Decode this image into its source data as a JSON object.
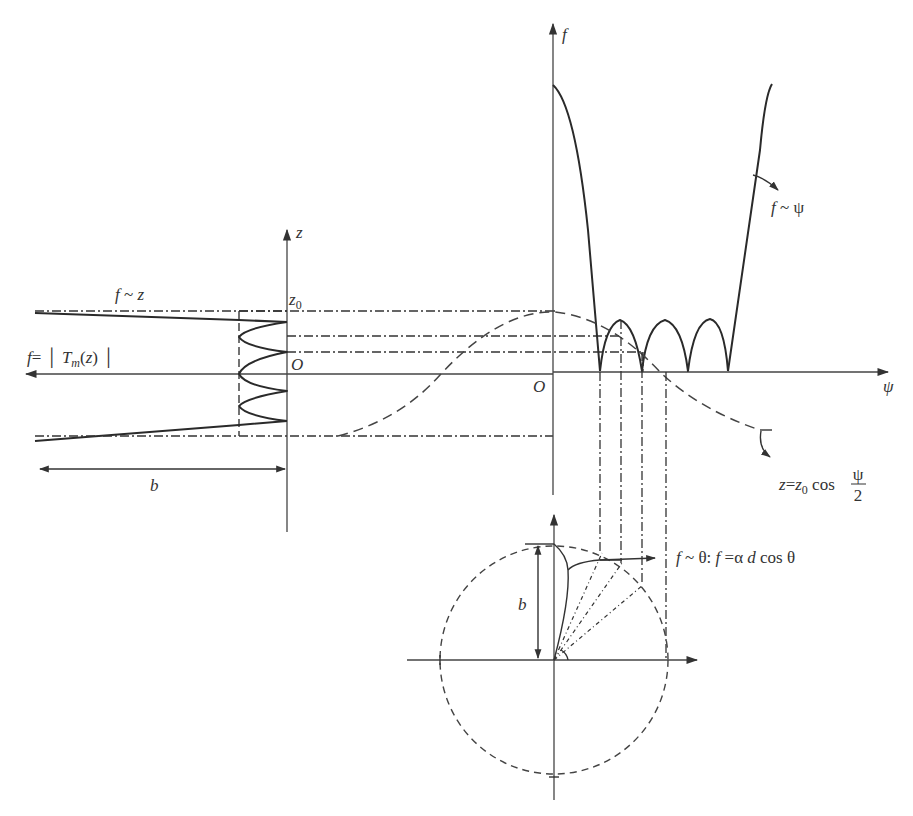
{
  "figure": {
    "type": "Chebyshev array pattern synthesis construction",
    "labels": {
      "f_axis": "f",
      "z_axis": "z",
      "psi_axis": "ψ",
      "z0": "z",
      "z0_sub": "0",
      "origin_left": "O",
      "origin_right": "O",
      "f_of_z": "f ~ z",
      "f_T_prefix": "f = ",
      "f_T_T": "T",
      "f_T_m": "m",
      "f_T_suffix": "(z)",
      "b_left": "b",
      "b_polar": "b",
      "f_psi": "f ~ ψ",
      "z_eq_prefix": "z=z",
      "z_eq_sub": "0",
      "z_eq_cos": " cos ",
      "z_eq_num": "ψ",
      "z_eq_den": "2",
      "f_theta": "f ~ θ: f =α d cos θ"
    },
    "panels": [
      {
        "name": "chebyshev-polynomial-panel",
        "description": "f = |T_m(z)| vs z, rotated"
      },
      {
        "name": "array-factor-panel",
        "description": "f vs ψ with z = z0 cos(ψ/2) mapping"
      },
      {
        "name": "polar-pattern-panel",
        "description": "f vs θ polar plot, circle radius b"
      }
    ],
    "colors": {
      "ink": "#2a2a2a",
      "background": "#ffffff"
    }
  }
}
